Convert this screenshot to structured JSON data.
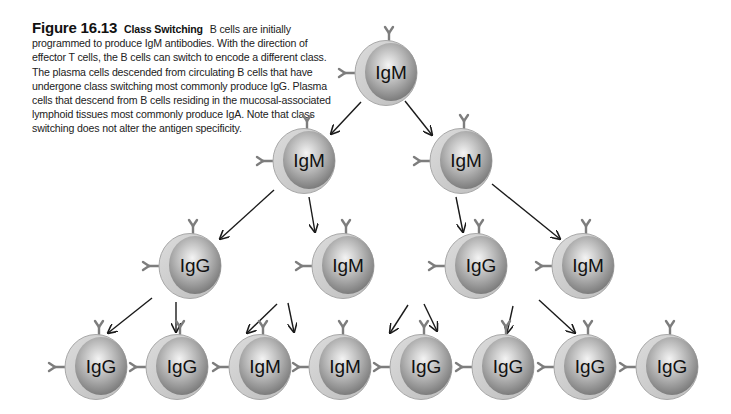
{
  "caption": {
    "figure_number": "Figure 16.13",
    "title": "Class Switching",
    "body": "B cells are initially programmed to produce IgM antibodies. With the direction of effector T cells, the B cells can switch to encode a different class. The plasma cells descended from circulating B cells that have undergone class switching most commonly produce IgG. Plasma cells that descend from B cells residing in the mucosal-associated lymphoid tissues most commonly produce IgA. Note that class switching does not alter the antigen specificity."
  },
  "colors": {
    "membrane": "#cfcfcf",
    "membrane_edge": "#a8a8a8",
    "nucleus_light": "#f2f2f2",
    "nucleus_dark": "#7a7a7a",
    "antibody": "#7d7d7d",
    "arrow": "#1a1a1a"
  },
  "cells": [
    {
      "id": "root",
      "label": "IgM",
      "level": 0,
      "x": 386,
      "y": 73
    },
    {
      "id": "l1a",
      "label": "IgM",
      "level": 1,
      "x": 304,
      "y": 161
    },
    {
      "id": "l1b",
      "label": "IgM",
      "level": 1,
      "x": 461,
      "y": 161
    },
    {
      "id": "l2a",
      "label": "IgG",
      "level": 2,
      "x": 190,
      "y": 266
    },
    {
      "id": "l2b",
      "label": "IgM",
      "level": 2,
      "x": 343,
      "y": 266
    },
    {
      "id": "l2c",
      "label": "IgG",
      "level": 2,
      "x": 476,
      "y": 266
    },
    {
      "id": "l2d",
      "label": "IgM",
      "level": 2,
      "x": 583,
      "y": 266
    },
    {
      "id": "l3a",
      "label": "IgG",
      "level": 3,
      "x": 96,
      "y": 367
    },
    {
      "id": "l3b",
      "label": "IgG",
      "level": 3,
      "x": 177,
      "y": 367
    },
    {
      "id": "l3c",
      "label": "IgM",
      "level": 3,
      "x": 260,
      "y": 367
    },
    {
      "id": "l3d",
      "label": "IgM",
      "level": 3,
      "x": 340,
      "y": 367
    },
    {
      "id": "l3e",
      "label": "IgG",
      "level": 3,
      "x": 421,
      "y": 367
    },
    {
      "id": "l3f",
      "label": "IgG",
      "level": 3,
      "x": 503,
      "y": 367
    },
    {
      "id": "l3g",
      "label": "IgG",
      "level": 3,
      "x": 585,
      "y": 367
    },
    {
      "id": "l3h",
      "label": "IgG",
      "level": 3,
      "x": 667,
      "y": 367
    }
  ],
  "arrows": [
    {
      "from": "root",
      "to": "l1a",
      "x1": 361,
      "y1": 102,
      "x2": 331,
      "y2": 134
    },
    {
      "from": "root",
      "to": "l1b",
      "x1": 405,
      "y1": 101,
      "x2": 432,
      "y2": 135
    },
    {
      "from": "l1a",
      "to": "l2a",
      "x1": 274,
      "y1": 190,
      "x2": 220,
      "y2": 239
    },
    {
      "from": "l1a",
      "to": "l2b",
      "x1": 309,
      "y1": 197,
      "x2": 315,
      "y2": 232
    },
    {
      "from": "l1b",
      "to": "l2c",
      "x1": 456,
      "y1": 197,
      "x2": 463,
      "y2": 232
    },
    {
      "from": "l1b",
      "to": "l2d",
      "x1": 492,
      "y1": 184,
      "x2": 560,
      "y2": 239
    },
    {
      "from": "l2a",
      "to": "l3a",
      "x1": 152,
      "y1": 298,
      "x2": 108,
      "y2": 333
    },
    {
      "from": "l2a",
      "to": "l3b",
      "x1": 176,
      "y1": 302,
      "x2": 176,
      "y2": 332
    },
    {
      "from": "l2b",
      "to": "l3c",
      "x1": 277,
      "y1": 304,
      "x2": 247,
      "y2": 333
    },
    {
      "from": "l2b",
      "to": "l3d",
      "x1": 288,
      "y1": 303,
      "x2": 294,
      "y2": 332
    },
    {
      "from": "l2c",
      "to": "l3e",
      "x1": 408,
      "y1": 305,
      "x2": 390,
      "y2": 333
    },
    {
      "from": "l2c",
      "to": "l3f",
      "x1": 424,
      "y1": 304,
      "x2": 437,
      "y2": 331
    },
    {
      "from": "l2d",
      "to": "l3g",
      "x1": 513,
      "y1": 306,
      "x2": 507,
      "y2": 333
    },
    {
      "from": "l2d",
      "to": "l3h",
      "x1": 539,
      "y1": 300,
      "x2": 575,
      "y2": 333
    }
  ]
}
